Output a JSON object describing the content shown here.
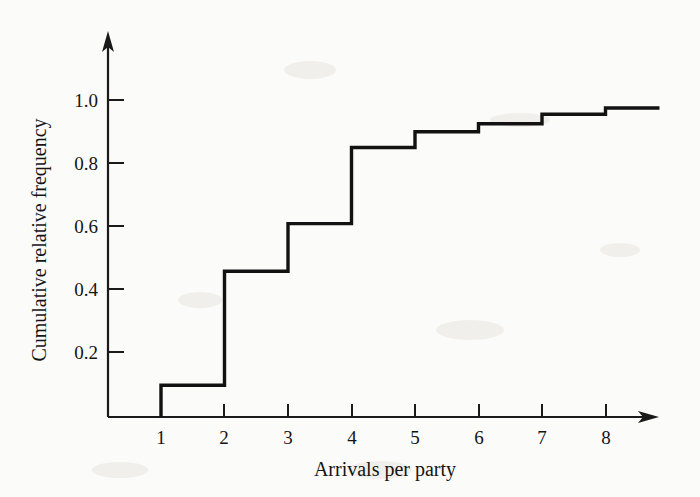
{
  "chart_data": {
    "type": "line",
    "subtype": "step-cumulative",
    "title": "",
    "xlabel": "Arrivals per party",
    "ylabel": "Cumulative relative frequency",
    "x": [
      1,
      2,
      3,
      4,
      5,
      6,
      7,
      8
    ],
    "values": [
      0.1,
      0.46,
      0.61,
      0.85,
      0.9,
      0.925,
      0.955,
      0.975
    ],
    "categories": [
      "1",
      "2",
      "3",
      "4",
      "5",
      "6",
      "7",
      "8"
    ],
    "x_tick_labels": [
      "1",
      "2",
      "3",
      "4",
      "5",
      "6",
      "7",
      "8"
    ],
    "y_tick_labels": [
      "0.2",
      "0.4",
      "0.6",
      "0.8",
      "1.0"
    ],
    "y_tick_values": [
      0.2,
      0.4,
      0.6,
      0.8,
      1.0
    ],
    "xlim": [
      0,
      9
    ],
    "ylim": [
      0,
      1.12
    ],
    "grid": false,
    "legend": false,
    "legend_position": "none",
    "line_color": "#121212",
    "axis_color": "#1a1a1a",
    "background_color": "#fbfbf9",
    "annotations": []
  },
  "axes": {
    "y_axis_name": "cumulative-relative-frequency-axis",
    "x_axis_name": "arrivals-per-party-axis",
    "y_arrow": true,
    "x_arrow": true
  }
}
